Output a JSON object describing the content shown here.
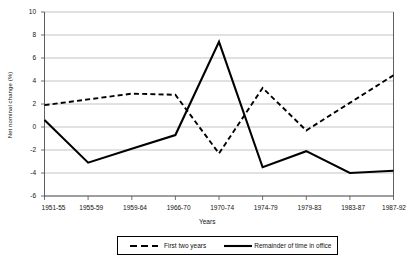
{
  "chart_data": {
    "type": "line",
    "title": "",
    "xlabel": "Years",
    "ylabel": "Net nominal change (%)",
    "categories": [
      "1951-55",
      "1955-59",
      "1959-64",
      "1966-70",
      "1970-74",
      "1974-79",
      "1979-83",
      "1983-87",
      "1987-92"
    ],
    "ylim": [
      -6,
      10
    ],
    "yticks": [
      10,
      8,
      6,
      4,
      2,
      0,
      -2,
      -4,
      -6
    ],
    "grid": true,
    "legend_position": "bottom",
    "series": [
      {
        "name": "First two years",
        "style": "dashed",
        "color": "#000000",
        "values": [
          1.9,
          2.4,
          2.9,
          2.8,
          -2.3,
          3.4,
          -0.3,
          2.1,
          4.5
        ]
      },
      {
        "name": "Remainder of time in office",
        "style": "solid",
        "color": "#000000",
        "values": [
          0.6,
          -3.1,
          -1.9,
          -0.7,
          7.4,
          -3.5,
          -2.1,
          -4.0,
          -3.8
        ]
      }
    ]
  },
  "axes": {
    "y_title": "Net nominal change (%)",
    "x_title": "Years",
    "y_tick_labels": [
      "10",
      "8",
      "6",
      "4",
      "2",
      "0",
      "-2",
      "-4",
      "-6"
    ],
    "x_tick_labels": [
      "1951-55",
      "1955-59",
      "1959-64",
      "1966-70",
      "1970-74",
      "1974-79",
      "1979-83",
      "1983-87",
      "1987-92"
    ]
  },
  "legend": {
    "items": [
      {
        "label": "First two years",
        "style": "dashed"
      },
      {
        "label": "Remainder of time in office",
        "style": "solid"
      }
    ]
  }
}
